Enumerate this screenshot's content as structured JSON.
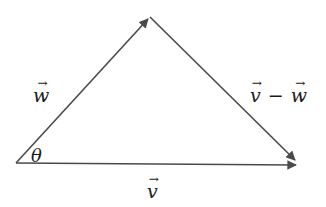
{
  "diagram": {
    "type": "vector-triangle",
    "colors": {
      "line": "#4a4a4a",
      "text": "#1a1a1a",
      "background": "#ffffff"
    },
    "vertices": {
      "origin": [
        16,
        163
      ],
      "apex": [
        150,
        17
      ],
      "end": [
        298,
        165
      ]
    },
    "labels": {
      "w": {
        "symbol": "w",
        "arrow": "→"
      },
      "v": {
        "symbol": "v",
        "arrow": "→"
      },
      "diff": {
        "left": "v",
        "op": "−",
        "right": "w",
        "arrow": "→"
      },
      "theta": "θ"
    },
    "edges": [
      {
        "name": "w",
        "from": "origin",
        "to": "apex",
        "arrowhead": true
      },
      {
        "name": "v",
        "from": "origin",
        "to": "end",
        "arrowhead": true
      },
      {
        "name": "v-minus-w",
        "from": "apex",
        "to": "end",
        "arrowhead": true
      }
    ]
  }
}
